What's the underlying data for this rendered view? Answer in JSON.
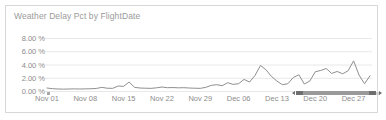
{
  "widget": {
    "title": "Weather Delay Pct by FlightDate",
    "border_color": "#d8d8d8",
    "background": "#ffffff"
  },
  "scrollbar": {
    "name": "horizontal-range-scrollbar",
    "track_color": "#cfcfcf",
    "thumb_color": "#9a9a9a",
    "grip_color": "#6e6e6e"
  },
  "chart_data": {
    "type": "line",
    "title": "Weather Delay Pct by FlightDate",
    "xlabel": "FlightDate",
    "ylabel": "Weather Delay Pct",
    "grid": true,
    "legend_position": "none",
    "line_color": "#8f8f8f",
    "axis_label_color": "#8c8c8c",
    "gridline_color": "#e8e8e8",
    "ylim": [
      0,
      9
    ],
    "ytick_values": [
      0,
      2,
      4,
      6,
      8
    ],
    "ytick_labels": [
      "0.00 %",
      "2.00 %",
      "4.00 %",
      "6.00 %",
      "8.00 %"
    ],
    "xtick_labels": [
      "Nov 01",
      "Nov 08",
      "Nov 15",
      "Nov 22",
      "Nov 29",
      "Dec 06",
      "Dec 13",
      "Dec 20",
      "Dec 27"
    ],
    "xtick_index": [
      0,
      7,
      14,
      21,
      28,
      35,
      42,
      49,
      56
    ],
    "x": [
      "Nov 01",
      "Nov 02",
      "Nov 03",
      "Nov 04",
      "Nov 05",
      "Nov 06",
      "Nov 07",
      "Nov 08",
      "Nov 09",
      "Nov 10",
      "Nov 11",
      "Nov 12",
      "Nov 13",
      "Nov 14",
      "Nov 15",
      "Nov 16",
      "Nov 17",
      "Nov 18",
      "Nov 19",
      "Nov 20",
      "Nov 21",
      "Nov 22",
      "Nov 23",
      "Nov 24",
      "Nov 25",
      "Nov 26",
      "Nov 27",
      "Nov 28",
      "Nov 29",
      "Nov 30",
      "Dec 01",
      "Dec 02",
      "Dec 03",
      "Dec 04",
      "Dec 05",
      "Dec 06",
      "Dec 07",
      "Dec 08",
      "Dec 09",
      "Dec 10",
      "Dec 11",
      "Dec 12",
      "Dec 13",
      "Dec 14",
      "Dec 15",
      "Dec 16",
      "Dec 17",
      "Dec 18",
      "Dec 19",
      "Dec 20",
      "Dec 21",
      "Dec 22",
      "Dec 23",
      "Dec 24",
      "Dec 25",
      "Dec 26",
      "Dec 27",
      "Dec 28",
      "Dec 29",
      "Dec 30"
    ],
    "values": [
      0.45,
      0.35,
      0.3,
      0.28,
      0.3,
      0.32,
      0.3,
      0.32,
      0.34,
      0.38,
      0.55,
      0.42,
      0.4,
      0.75,
      0.7,
      1.35,
      0.55,
      0.45,
      0.42,
      0.4,
      0.48,
      0.6,
      0.5,
      0.52,
      0.48,
      0.5,
      0.45,
      0.42,
      0.4,
      0.55,
      0.85,
      0.95,
      0.8,
      1.25,
      1.0,
      1.1,
      1.75,
      1.35,
      2.35,
      3.85,
      3.2,
      2.2,
      1.5,
      0.95,
      1.1,
      2.05,
      2.45,
      1.05,
      1.5,
      2.9,
      3.1,
      3.4,
      2.65,
      2.95,
      2.6,
      3.05,
      4.55,
      2.4,
      1.1,
      2.3
    ]
  }
}
